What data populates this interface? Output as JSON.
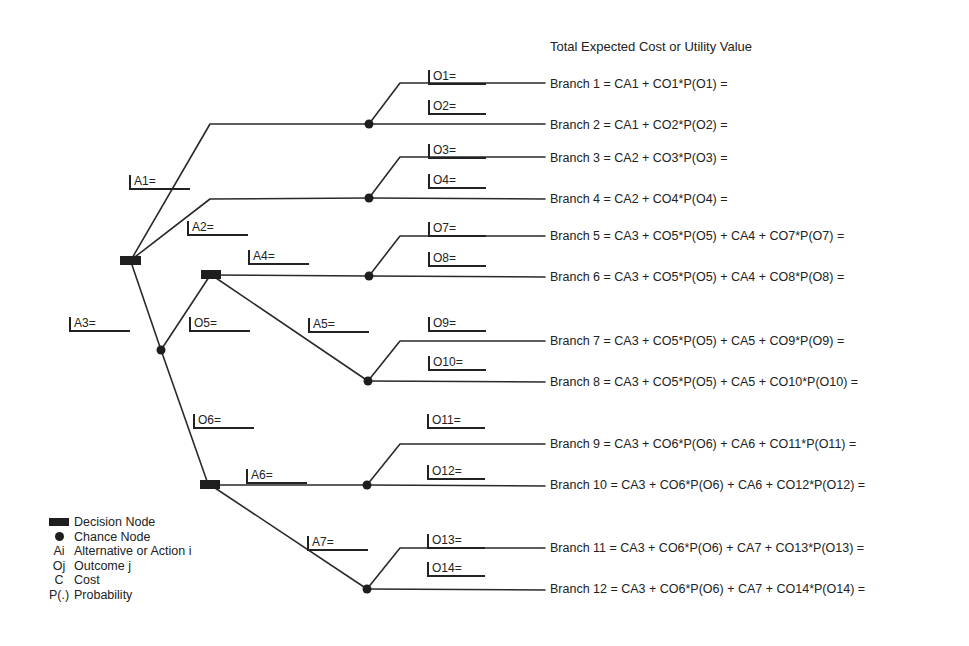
{
  "title": "Total Expected Cost or Utility Value",
  "alternatives": {
    "A1": "A1=",
    "A2": "A2=",
    "A3": "A3=",
    "A4": "A4=",
    "A5": "A5=",
    "A6": "A6=",
    "A7": "A7="
  },
  "outcomes": {
    "O1": "O1=",
    "O2": "O2=",
    "O3": "O3=",
    "O4": "O4=",
    "O5": "O5=",
    "O6": "O6=",
    "O7": "O7=",
    "O8": "O8=",
    "O9": "O9=",
    "O10": "O10=",
    "O11": "O11=",
    "O12": "O12=",
    "O13": "O13=",
    "O14": "O14="
  },
  "branches": [
    "Branch 1 = CA1 + CO1*P(O1) =",
    "Branch 2 = CA1 + CO2*P(O2) =",
    "Branch 3 = CA2 + CO3*P(O3) =",
    "Branch 4 = CA2 + CO4*P(O4) =",
    "Branch 5 = CA3 + CO5*P(O5) + CA4 + CO7*P(O7) =",
    "Branch 6 = CA3 + CO5*P(O5) + CA4 + CO8*P(O8) =",
    "Branch 7 = CA3 + CO5*P(O5) + CA5 + CO9*P(O9) =",
    "Branch 8 = CA3 + CO5*P(O5) + CA5 + CO10*P(O10) =",
    "Branch 9 = CA3 + CO6*P(O6) + CA6 + CO11*P(O11) =",
    "Branch 10 = CA3 + CO6*P(O6) + CA6 + CO12*P(O12) =",
    "Branch 11 = CA3 + CO6*P(O6) + CA7 + CO13*P(O13) =",
    "Branch 12 = CA3 + CO6*P(O6) + CA7 + CO14*P(O14) ="
  ],
  "legend": [
    {
      "symbol": "decision-node",
      "key": "",
      "label": "Decision Node"
    },
    {
      "symbol": "chance-node",
      "key": "",
      "label": "Chance Node"
    },
    {
      "symbol": "text",
      "key": "Ai",
      "label": "Alternative or Action i"
    },
    {
      "symbol": "text",
      "key": "Oj",
      "label": "Outcome j"
    },
    {
      "symbol": "text",
      "key": "C",
      "label": "Cost"
    },
    {
      "symbol": "text",
      "key": "P(.)",
      "label": "Probability"
    }
  ],
  "colors": {
    "line": "#2a2a2a",
    "node": "#1e1e1e",
    "background": "#ffffff"
  }
}
